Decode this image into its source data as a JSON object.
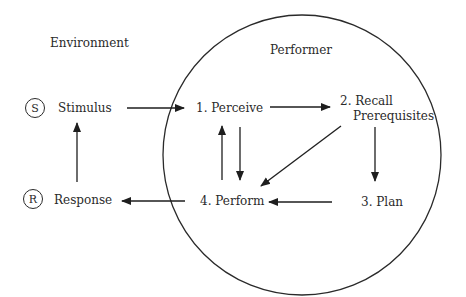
{
  "diagram": {
    "regions": {
      "environment": "Environment",
      "performer": "Performer"
    },
    "environment_nodes": {
      "stimulus": {
        "symbol": "S",
        "label": "Stimulus"
      },
      "response": {
        "symbol": "R",
        "label": "Response"
      }
    },
    "performer_nodes": {
      "perceive": "1. Perceive",
      "recall_line1": "2. Recall",
      "recall_line2": "Prerequisites",
      "plan": "3. Plan",
      "perform": "4. Perform"
    },
    "edges": [
      {
        "from": "Stimulus",
        "to": "1. Perceive"
      },
      {
        "from": "1. Perceive",
        "to": "2. Recall Prerequisites"
      },
      {
        "from": "2. Recall Prerequisites",
        "to": "3. Plan"
      },
      {
        "from": "2. Recall Prerequisites",
        "to": "4. Perform"
      },
      {
        "from": "3. Plan",
        "to": "4. Perform"
      },
      {
        "from": "1. Perceive",
        "to": "4. Perform"
      },
      {
        "from": "4. Perform",
        "to": "1. Perceive"
      },
      {
        "from": "4. Perform",
        "to": "Response"
      },
      {
        "from": "Response",
        "to": "Stimulus"
      }
    ]
  }
}
